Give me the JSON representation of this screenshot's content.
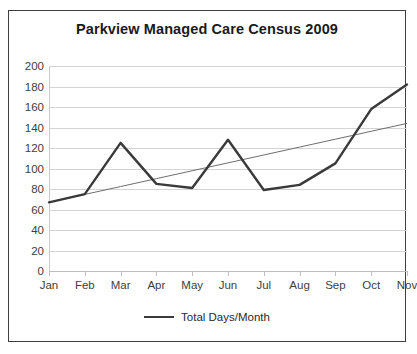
{
  "chart_data": {
    "type": "line",
    "title": "Parkview Managed Care Census 2009",
    "xlabel": "",
    "ylabel": "",
    "categories": [
      "Jan",
      "Feb",
      "Mar",
      "Apr",
      "May",
      "Jun",
      "Jul",
      "Aug",
      "Sep",
      "Oct",
      "Nov"
    ],
    "series": [
      {
        "name": "Total Days/Month",
        "color": "#3a3a3a",
        "values": [
          67,
          75,
          125,
          85,
          81,
          128,
          79,
          84,
          105,
          158,
          182
        ]
      },
      {
        "name": "Linear trendline",
        "color": "#6e6e6e",
        "trendline": true,
        "values": [
          67,
          74.7,
          82.4,
          90.1,
          97.8,
          105.5,
          113.2,
          120.9,
          128.6,
          136.3,
          144
        ]
      }
    ],
    "ylim": [
      0,
      200
    ],
    "ytick_step": 20,
    "yticks": [
      200,
      180,
      160,
      140,
      120,
      100,
      80,
      60,
      40,
      20,
      0
    ],
    "grid": true,
    "grid_axis": "y",
    "legend": {
      "position": "bottom",
      "entries": [
        "Total Days/Month"
      ]
    }
  },
  "legend": {
    "label": "Total Days/Month"
  }
}
